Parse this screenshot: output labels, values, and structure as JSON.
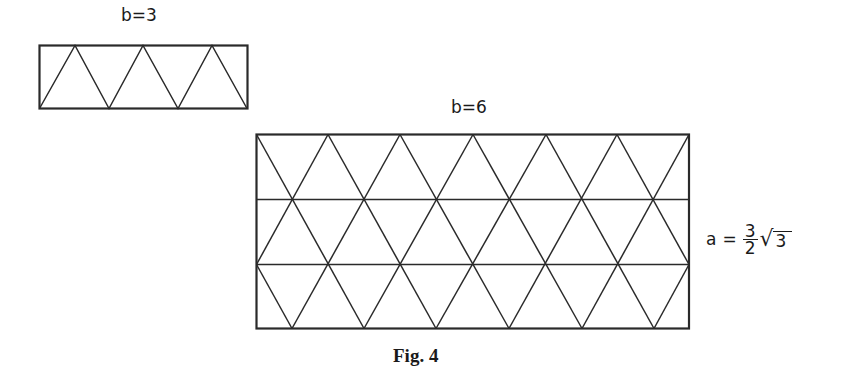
{
  "figure": {
    "caption": "Fig. 4",
    "small_panel": {
      "label": "b=3",
      "rect": {
        "x": 39,
        "y": 45,
        "w": 208,
        "h": 63
      },
      "triangles_per_row": 3,
      "rows": 1
    },
    "large_panel": {
      "label": "b=6",
      "rect": {
        "x": 256,
        "y": 134,
        "w": 433,
        "h": 194
      },
      "triangles_per_row": 6,
      "rows": 3,
      "side_formula": {
        "lhs": "a",
        "eq": "=",
        "numerator": "3",
        "denominator": "2",
        "radical_sign": "√",
        "radicand": "3"
      }
    },
    "stroke_color": "#2a2a2a",
    "background": "#ffffff"
  }
}
